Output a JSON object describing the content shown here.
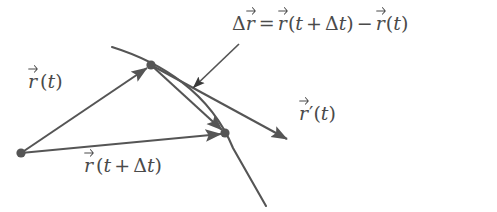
{
  "figure": {
    "background_color": "#ffffff",
    "stroke_color": "#555555",
    "text_color": "#4a4a4a",
    "width": 497,
    "height": 212
  },
  "labels": {
    "delta_r_equation": {
      "text": "Δr⃗ = r⃗(t + Δt) − r⃗(t)",
      "delta": "Δ",
      "r": "r",
      "equals": "=",
      "open_paren": "(",
      "t": "t",
      "plus": "+",
      "delta_t_delta": "Δ",
      "delta_t_t": "t",
      "close_paren": ")",
      "minus": "−"
    },
    "r_of_t": {
      "text": "r⃗(t)",
      "r": "r",
      "open_paren": "(",
      "t": "t",
      "close_paren": ")"
    },
    "r_of_t_plus_delta_t": {
      "text": "r⃗(t + Δt)",
      "r": "r",
      "open_paren": "(",
      "t": "t",
      "plus": "+",
      "delta": "Δ",
      "delta_t": "t",
      "close_paren": ")"
    },
    "r_prime_of_t": {
      "text": "r⃗′(t)",
      "r": "r",
      "prime": "′",
      "open_paren": "(",
      "t": "t",
      "close_paren": ")"
    },
    "clipped_top_row": {
      "text": ""
    }
  },
  "geometry": {
    "origin_point": {
      "x": 21,
      "y": 153,
      "name": "origin-dot"
    },
    "point_t": {
      "x": 151,
      "y": 65,
      "name": "point-r-of-t"
    },
    "point_t_plus_dt": {
      "x": 225,
      "y": 133,
      "name": "point-r-of-t-plus-delta-t"
    },
    "trajectory_curve": {
      "start": {
        "x": 112,
        "y": 47
      },
      "control1": {
        "x": 185,
        "y": 72
      },
      "control2": {
        "x": 228,
        "y": 112
      },
      "end": {
        "x": 266,
        "y": 206
      }
    },
    "vector_r_of_t": {
      "from": {
        "x": 21,
        "y": 153
      },
      "to": {
        "x": 151,
        "y": 65
      }
    },
    "vector_r_of_t_plus_dt": {
      "from": {
        "x": 21,
        "y": 153
      },
      "to": {
        "x": 225,
        "y": 133
      }
    },
    "vector_delta_r": {
      "from": {
        "x": 151,
        "y": 65
      },
      "to": {
        "x": 225,
        "y": 133
      }
    },
    "vector_r_prime": {
      "from": {
        "x": 151,
        "y": 65
      },
      "to": {
        "x": 291,
        "y": 141
      }
    },
    "pointer_to_delta_r": {
      "from": {
        "x": 239,
        "y": 44
      },
      "to": {
        "x": 191,
        "y": 90
      }
    }
  }
}
